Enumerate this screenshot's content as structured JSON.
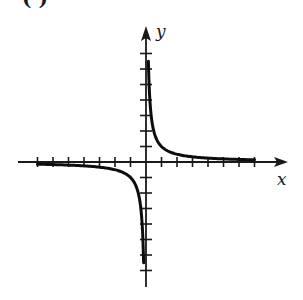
{
  "figure": {
    "part_label": "( )",
    "x_axis_label": "x",
    "y_axis_label": "y"
  },
  "colors": {
    "axis": "#1a1a1a",
    "curve": "#0d0d0d",
    "background": "#ffffff"
  },
  "chart_data": {
    "type": "line",
    "title": "",
    "function": "y = 1/x",
    "xlabel": "x",
    "ylabel": "y",
    "xlim": [
      -8,
      8
    ],
    "ylim": [
      -8,
      8
    ],
    "x_ticks": [
      -7,
      -6,
      -5,
      -4,
      -3,
      -2,
      -1,
      1,
      2,
      3,
      4,
      5,
      6,
      7
    ],
    "y_ticks": [
      -7,
      -6,
      -5,
      -4,
      -3,
      -2,
      -1,
      1,
      2,
      3,
      4,
      5,
      6,
      7
    ],
    "tick_labels_shown": false,
    "grid": false,
    "legend": null,
    "series": [
      {
        "name": "branch-positive",
        "x": [
          0.14,
          0.2,
          0.25,
          0.33,
          0.5,
          0.75,
          1,
          1.5,
          2,
          3,
          4,
          5,
          6,
          7
        ],
        "y": [
          7.0,
          5.0,
          4.0,
          3.0,
          2.0,
          1.33,
          1.0,
          0.67,
          0.5,
          0.33,
          0.25,
          0.2,
          0.17,
          0.14
        ]
      },
      {
        "name": "branch-negative",
        "x": [
          -7,
          -6,
          -5,
          -4,
          -3,
          -2,
          -1.5,
          -1,
          -0.75,
          -0.5,
          -0.33,
          -0.25,
          -0.2,
          -0.14
        ],
        "y": [
          -0.14,
          -0.17,
          -0.2,
          -0.25,
          -0.33,
          -0.5,
          -0.67,
          -1.0,
          -1.33,
          -2.0,
          -3.0,
          -4.0,
          -5.0,
          -7.0
        ]
      }
    ],
    "asymptotes": {
      "vertical": 0,
      "horizontal": 0
    }
  }
}
